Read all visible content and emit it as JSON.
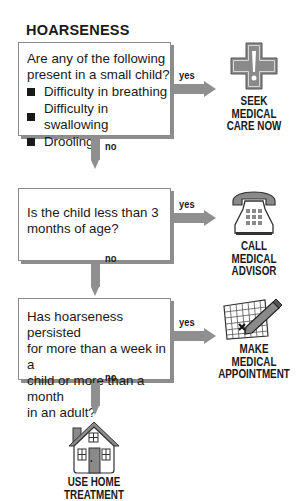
{
  "title": "HOARSENESS",
  "steps": [
    {
      "question": "Are any of the following present in a small child?",
      "question_lines": [
        "Are any of the following",
        "present in a small child?"
      ],
      "bullets": [
        "Difficulty in breathing",
        "Difficulty in swallowing",
        "Drooling"
      ],
      "yes_label": "yes",
      "no_label": "no",
      "action": {
        "icon": "medical-cross-icon",
        "lines": [
          "SEEK",
          "MEDICAL",
          "CARE NOW"
        ]
      }
    },
    {
      "question_lines": [
        "Is the child less than 3",
        "months of age?"
      ],
      "yes_label": "yes",
      "no_label": "no",
      "action": {
        "icon": "telephone-icon",
        "lines": [
          "CALL",
          "MEDICAL",
          "ADVISOR"
        ]
      }
    },
    {
      "question_lines": [
        "Has hoarseness persisted",
        "for more than a week in a",
        "child or more than a month",
        "in an adult?"
      ],
      "yes_label": "yes",
      "no_label": "no",
      "action": {
        "icon": "calendar-pencil-icon",
        "lines": [
          "MAKE",
          "MEDICAL",
          "APPOINTMENT"
        ]
      }
    }
  ],
  "final": {
    "icon": "house-icon",
    "lines": [
      "USE HOME",
      "TREATMENT"
    ]
  },
  "colors": {
    "arrow": "#8f8f8f",
    "icon_fill": "#8a8a8a",
    "text": "#1a1a1a"
  }
}
